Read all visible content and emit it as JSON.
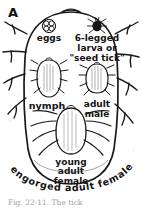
{
  "figure": {
    "panel_label": "A",
    "background_color": "#ffffff",
    "ink_color": "#1a1a1a"
  },
  "labels": {
    "eggs": "eggs",
    "larva_line1": "6-legged",
    "larva_line2": "larva or",
    "larva_line3": "\"seed tick\"",
    "nymph": "nymph",
    "adult_male_line1": "adult",
    "adult_male_line2": "male",
    "young_female_line1": "young",
    "young_female_line2": "adult",
    "young_female_line3": "female",
    "engorged_curved": "engorged adult female"
  },
  "curved_text_letters": [
    "e",
    "n",
    "g",
    "o",
    "r",
    "g",
    "e",
    "d",
    " ",
    "a",
    "d",
    "u",
    "l",
    "t",
    " ",
    "f",
    "e",
    "m",
    "a",
    "l",
    "e"
  ],
  "caption": {
    "text": "Fig.  22-11.   The        tick"
  },
  "icons": {
    "egg_cluster": "egg-cluster-icon",
    "larva": "larva-tick-icon",
    "nymph": "nymph-tick-icon",
    "adult_male": "adult-male-tick-icon",
    "young_adult_female": "young-adult-female-tick-icon",
    "engorged_outline": "engorged-female-outline-icon"
  }
}
